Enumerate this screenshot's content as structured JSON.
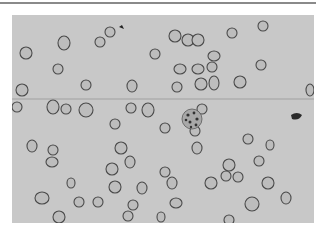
{
  "image": {
    "description": "Light micrograph of a blood smear showing many red blood cells and one granular cell",
    "colors": {
      "background": "#c8c8c8",
      "cell_edge": "#4a4a4a",
      "cell_fill": "#bdbdbd",
      "page": "#ffffff",
      "rule": "#8a8a8a"
    }
  }
}
